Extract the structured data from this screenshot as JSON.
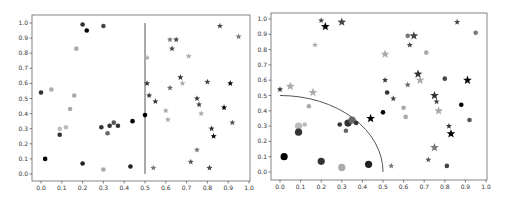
{
  "figure": {
    "panels": 2
  },
  "chart_data": [
    {
      "type": "scatter",
      "title": "",
      "xlabel": "",
      "ylabel": "",
      "xlim": [
        -0.05,
        1.0
      ],
      "ylim": [
        -0.05,
        1.05
      ],
      "xticks": [
        "0.0",
        "0.1",
        "0.2",
        "0.3",
        "0.4",
        "0.5",
        "0.6",
        "0.7",
        "0.8",
        "0.9",
        "1.0"
      ],
      "yticks": [
        "0.0",
        "0.1",
        "0.2",
        "0.3",
        "0.4",
        "0.5",
        "0.6",
        "0.7",
        "0.8",
        "0.9",
        "1.0"
      ],
      "grid": false,
      "decision_boundary": {
        "shape": "vertical-line",
        "x": 0.5,
        "y_range": [
          0.0,
          1.0
        ],
        "color": "#555555"
      },
      "series": [
        {
          "name": "class-left (circles)",
          "marker": "circle",
          "points": [
            {
              "x": 0.0,
              "y": 0.54,
              "shade": "#333333"
            },
            {
              "x": 0.02,
              "y": 0.1,
              "shade": "#000000"
            },
            {
              "x": 0.05,
              "y": 0.56,
              "shade": "#aaaaaa"
            },
            {
              "x": 0.09,
              "y": 0.3,
              "shade": "#bbbbbb"
            },
            {
              "x": 0.09,
              "y": 0.26,
              "shade": "#333333"
            },
            {
              "x": 0.12,
              "y": 0.31,
              "shade": "#bbbbbb"
            },
            {
              "x": 0.14,
              "y": 0.43,
              "shade": "#aaaaaa"
            },
            {
              "x": 0.16,
              "y": 0.52,
              "shade": "#aaaaaa"
            },
            {
              "x": 0.17,
              "y": 0.83,
              "shade": "#aaaaaa"
            },
            {
              "x": 0.2,
              "y": 0.99,
              "shade": "#333333"
            },
            {
              "x": 0.2,
              "y": 0.07,
              "shade": "#222222"
            },
            {
              "x": 0.22,
              "y": 0.95,
              "shade": "#000000"
            },
            {
              "x": 0.29,
              "y": 0.31,
              "shade": "#333333"
            },
            {
              "x": 0.3,
              "y": 0.98,
              "shade": "#444444"
            },
            {
              "x": 0.3,
              "y": 0.03,
              "shade": "#aaaaaa"
            },
            {
              "x": 0.32,
              "y": 0.27,
              "shade": "#666666"
            },
            {
              "x": 0.33,
              "y": 0.32,
              "shade": "#333333"
            },
            {
              "x": 0.35,
              "y": 0.34,
              "shade": "#555555"
            },
            {
              "x": 0.37,
              "y": 0.32,
              "shade": "#333333"
            },
            {
              "x": 0.43,
              "y": 0.05,
              "shade": "#222222"
            },
            {
              "x": 0.44,
              "y": 0.35,
              "shade": "#000000"
            },
            {
              "x": 0.5,
              "y": 0.39,
              "shade": "#000000"
            }
          ]
        },
        {
          "name": "class-right (stars)",
          "marker": "star",
          "points": [
            {
              "x": 0.51,
              "y": 0.77,
              "shade": "#aaaaaa"
            },
            {
              "x": 0.51,
              "y": 0.6,
              "shade": "#333333"
            },
            {
              "x": 0.52,
              "y": 0.52,
              "shade": "#333333"
            },
            {
              "x": 0.54,
              "y": 0.04,
              "shade": "#777777"
            },
            {
              "x": 0.55,
              "y": 0.48,
              "shade": "#333333"
            },
            {
              "x": 0.6,
              "y": 0.42,
              "shade": "#aaaaaa"
            },
            {
              "x": 0.61,
              "y": 0.36,
              "shade": "#aaaaaa"
            },
            {
              "x": 0.62,
              "y": 0.89,
              "shade": "#777777"
            },
            {
              "x": 0.62,
              "y": 0.57,
              "shade": "#666666"
            },
            {
              "x": 0.63,
              "y": 0.83,
              "shade": "#444444"
            },
            {
              "x": 0.65,
              "y": 0.89,
              "shade": "#444444"
            },
            {
              "x": 0.67,
              "y": 0.64,
              "shade": "#333333"
            },
            {
              "x": 0.68,
              "y": 0.6,
              "shade": "#aaaaaa"
            },
            {
              "x": 0.71,
              "y": 0.78,
              "shade": "#aaaaaa"
            },
            {
              "x": 0.72,
              "y": 0.08,
              "shade": "#555555"
            },
            {
              "x": 0.75,
              "y": 0.16,
              "shade": "#777777"
            },
            {
              "x": 0.75,
              "y": 0.5,
              "shade": "#333333"
            },
            {
              "x": 0.76,
              "y": 0.46,
              "shade": "#444444"
            },
            {
              "x": 0.77,
              "y": 0.4,
              "shade": "#aaaaaa"
            },
            {
              "x": 0.8,
              "y": 0.61,
              "shade": "#444444"
            },
            {
              "x": 0.81,
              "y": 0.04,
              "shade": "#444444"
            },
            {
              "x": 0.82,
              "y": 0.3,
              "shade": "#333333"
            },
            {
              "x": 0.83,
              "y": 0.25,
              "shade": "#000000"
            },
            {
              "x": 0.86,
              "y": 0.98,
              "shade": "#444444"
            },
            {
              "x": 0.88,
              "y": 0.44,
              "shade": "#000000"
            },
            {
              "x": 0.91,
              "y": 0.6,
              "shade": "#000000"
            },
            {
              "x": 0.92,
              "y": 0.34,
              "shade": "#555555"
            },
            {
              "x": 0.95,
              "y": 0.91,
              "shade": "#777777"
            }
          ]
        }
      ]
    },
    {
      "type": "scatter",
      "title": "",
      "xlabel": "",
      "ylabel": "",
      "xlim": [
        -0.05,
        1.0
      ],
      "ylim": [
        -0.05,
        1.05
      ],
      "xticks": [
        "0.0",
        "0.1",
        "0.2",
        "0.3",
        "0.4",
        "0.5",
        "0.6",
        "0.7",
        "0.8",
        "0.9",
        "1.0"
      ],
      "yticks": [
        "0.0",
        "0.1",
        "0.2",
        "0.3",
        "0.4",
        "0.5",
        "0.6",
        "0.7",
        "0.8",
        "0.9",
        "1.0"
      ],
      "grid": false,
      "decision_boundary": {
        "shape": "quarter-circle",
        "center": [
          0.0,
          0.0
        ],
        "radius": 0.5,
        "color": "#555555"
      },
      "series": [
        {
          "name": "inside-circle (circles)",
          "marker": "circle",
          "points": [
            {
              "x": 0.02,
              "y": 0.1,
              "shade": "#000000",
              "size": "large"
            },
            {
              "x": 0.09,
              "y": 0.3,
              "shade": "#bbbbbb",
              "size": "large"
            },
            {
              "x": 0.09,
              "y": 0.26,
              "shade": "#333333",
              "size": "large"
            },
            {
              "x": 0.12,
              "y": 0.31,
              "shade": "#bbbbbb",
              "size": "small"
            },
            {
              "x": 0.2,
              "y": 0.07,
              "shade": "#333333",
              "size": "large"
            },
            {
              "x": 0.29,
              "y": 0.31,
              "shade": "#333333",
              "size": "small"
            },
            {
              "x": 0.3,
              "y": 0.03,
              "shade": "#aaaaaa",
              "size": "large"
            },
            {
              "x": 0.32,
              "y": 0.27,
              "shade": "#666666",
              "size": "small"
            },
            {
              "x": 0.33,
              "y": 0.32,
              "shade": "#333333",
              "size": "large"
            },
            {
              "x": 0.35,
              "y": 0.34,
              "shade": "#666666",
              "size": "large"
            },
            {
              "x": 0.37,
              "y": 0.32,
              "shade": "#333333",
              "size": "small"
            },
            {
              "x": 0.43,
              "y": 0.05,
              "shade": "#222222",
              "size": "large"
            },
            {
              "x": 0.14,
              "y": 0.43,
              "shade": "#aaaaaa",
              "size": "small"
            },
            {
              "x": 0.5,
              "y": 0.39,
              "shade": "#000000",
              "size": "small"
            },
            {
              "x": 0.52,
              "y": 0.52,
              "shade": "#333333",
              "size": "small"
            },
            {
              "x": 0.6,
              "y": 0.42,
              "shade": "#aaaaaa",
              "size": "small"
            },
            {
              "x": 0.61,
              "y": 0.36,
              "shade": "#aaaaaa",
              "size": "small"
            },
            {
              "x": 0.62,
              "y": 0.89,
              "shade": "#777777",
              "size": "small"
            },
            {
              "x": 0.71,
              "y": 0.78,
              "shade": "#aaaaaa",
              "size": "small"
            },
            {
              "x": 0.8,
              "y": 0.61,
              "shade": "#444444",
              "size": "small"
            },
            {
              "x": 0.81,
              "y": 0.04,
              "shade": "#444444",
              "size": "small"
            },
            {
              "x": 0.88,
              "y": 0.44,
              "shade": "#000000",
              "size": "small"
            },
            {
              "x": 0.92,
              "y": 0.34,
              "shade": "#555555",
              "size": "small"
            },
            {
              "x": 0.95,
              "y": 0.91,
              "shade": "#777777",
              "size": "small"
            }
          ]
        },
        {
          "name": "outside-circle (stars)",
          "marker": "star",
          "points": [
            {
              "x": 0.0,
              "y": 0.54,
              "shade": "#333333",
              "size": "small"
            },
            {
              "x": 0.05,
              "y": 0.56,
              "shade": "#aaaaaa",
              "size": "large"
            },
            {
              "x": 0.16,
              "y": 0.52,
              "shade": "#aaaaaa",
              "size": "large"
            },
            {
              "x": 0.17,
              "y": 0.83,
              "shade": "#aaaaaa",
              "size": "small"
            },
            {
              "x": 0.2,
              "y": 0.99,
              "shade": "#444444",
              "size": "small"
            },
            {
              "x": 0.22,
              "y": 0.95,
              "shade": "#000000",
              "size": "large"
            },
            {
              "x": 0.3,
              "y": 0.98,
              "shade": "#444444",
              "size": "large"
            },
            {
              "x": 0.44,
              "y": 0.35,
              "shade": "#000000",
              "size": "large"
            },
            {
              "x": 0.51,
              "y": 0.77,
              "shade": "#aaaaaa",
              "size": "large"
            },
            {
              "x": 0.51,
              "y": 0.6,
              "shade": "#333333",
              "size": "small"
            },
            {
              "x": 0.54,
              "y": 0.04,
              "shade": "#777777",
              "size": "small"
            },
            {
              "x": 0.55,
              "y": 0.48,
              "shade": "#444444",
              "size": "small"
            },
            {
              "x": 0.62,
              "y": 0.57,
              "shade": "#666666",
              "size": "small"
            },
            {
              "x": 0.63,
              "y": 0.83,
              "shade": "#444444",
              "size": "small"
            },
            {
              "x": 0.65,
              "y": 0.89,
              "shade": "#444444",
              "size": "large"
            },
            {
              "x": 0.67,
              "y": 0.64,
              "shade": "#333333",
              "size": "large"
            },
            {
              "x": 0.68,
              "y": 0.6,
              "shade": "#aaaaaa",
              "size": "large"
            },
            {
              "x": 0.72,
              "y": 0.08,
              "shade": "#555555",
              "size": "small"
            },
            {
              "x": 0.75,
              "y": 0.16,
              "shade": "#777777",
              "size": "large"
            },
            {
              "x": 0.75,
              "y": 0.5,
              "shade": "#333333",
              "size": "large"
            },
            {
              "x": 0.76,
              "y": 0.46,
              "shade": "#444444",
              "size": "small"
            },
            {
              "x": 0.77,
              "y": 0.4,
              "shade": "#aaaaaa",
              "size": "large"
            },
            {
              "x": 0.82,
              "y": 0.3,
              "shade": "#333333",
              "size": "small"
            },
            {
              "x": 0.83,
              "y": 0.25,
              "shade": "#000000",
              "size": "large"
            },
            {
              "x": 0.86,
              "y": 0.98,
              "shade": "#444444",
              "size": "small"
            },
            {
              "x": 0.91,
              "y": 0.6,
              "shade": "#000000",
              "size": "large"
            }
          ]
        }
      ]
    }
  ],
  "layout": {
    "panels": [
      {
        "frame": {
          "left": 32,
          "top": 15,
          "right": 250,
          "bottom": 181
        },
        "x0_px": 41,
        "x1_px": 249,
        "y0_px": 174,
        "y1_px": 23
      },
      {
        "frame": {
          "left": 271,
          "top": 13,
          "right": 487,
          "bottom": 180
        },
        "x0_px": 280,
        "x1_px": 486,
        "y0_px": 172,
        "y1_px": 19
      }
    ],
    "frame_color": "#666666",
    "tick_color": "#333333"
  }
}
